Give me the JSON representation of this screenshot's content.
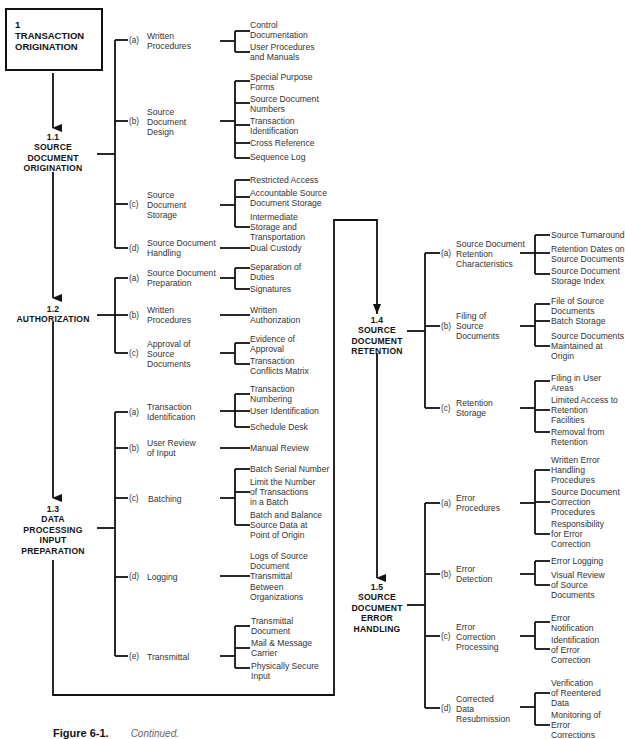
{
  "figure": {
    "label": "Figure 6-1.",
    "caption": "Continued."
  },
  "root": {
    "number": "1",
    "title_line1": "TRANSACTION",
    "title_line2": "ORIGINATION"
  },
  "sections": [
    {
      "id": "1.1",
      "title_lines": [
        "SOURCE",
        "DOCUMENT",
        "ORIGINATION"
      ],
      "items": [
        {
          "marker": "(a)",
          "label_lines": [
            "Written",
            "Procedures"
          ],
          "leaves": [
            [
              "Control",
              "Documentation"
            ],
            [
              "User Procedures",
              "and Manuals"
            ]
          ]
        },
        {
          "marker": "(b)",
          "label_lines": [
            "Source",
            "Document",
            "Design"
          ],
          "leaves": [
            [
              "Special Purpose",
              "Forms"
            ],
            [
              "Source Document",
              "Numbers"
            ],
            [
              "Transaction",
              "Identification"
            ],
            [
              "Cross Reference"
            ],
            [
              "Sequence Log"
            ]
          ]
        },
        {
          "marker": "(c)",
          "label_lines": [
            "Source",
            "Document",
            "Storage"
          ],
          "leaves": [
            [
              "Restricted Access"
            ],
            [
              "Accountable Source",
              "Document Storage"
            ],
            [
              "Intermediate",
              "Storage and",
              "Transportation"
            ]
          ]
        },
        {
          "marker": "(d)",
          "label_lines": [
            "Source Document",
            "Handling"
          ],
          "leaves": [
            [
              "Dual Custody"
            ]
          ]
        }
      ]
    },
    {
      "id": "1.2",
      "title_lines": [
        "AUTHORIZATION"
      ],
      "items": [
        {
          "marker": "(a)",
          "label_lines": [
            "Source Document",
            "Preparation"
          ],
          "leaves": [
            [
              "Separation of",
              "Duties"
            ],
            [
              "Signatures"
            ]
          ]
        },
        {
          "marker": "(b)",
          "label_lines": [
            "Written",
            "Procedures"
          ],
          "leaves": [
            [
              "Written",
              "Authorization"
            ]
          ]
        },
        {
          "marker": "(c)",
          "label_lines": [
            "Approval of",
            "Source",
            "Documents"
          ],
          "leaves": [
            [
              "Evidence of",
              "Approval"
            ],
            [
              "Transaction",
              "Conflicts Matrix"
            ]
          ]
        }
      ]
    },
    {
      "id": "1.3",
      "title_lines": [
        "DATA",
        "PROCESSING",
        "INPUT",
        "PREPARATION"
      ],
      "items": [
        {
          "marker": "(a)",
          "label_lines": [
            "Transaction",
            "Identification"
          ],
          "leaves": [
            [
              "Transaction",
              "Numbering"
            ],
            [
              "User Identification"
            ],
            [
              "Schedule Desk"
            ]
          ]
        },
        {
          "marker": "(b)",
          "label_lines": [
            "User Review",
            "of Input"
          ],
          "leaves": [
            [
              "Manual Review"
            ]
          ]
        },
        {
          "marker": "(c)",
          "label_lines": [
            "Batching"
          ],
          "leaves": [
            [
              "Batch Serial Number"
            ],
            [
              "Limit the Number",
              "of Transactions",
              "in a Batch"
            ],
            [
              "Batch and Balance",
              "Source Data at",
              "Point of Origin"
            ]
          ]
        },
        {
          "marker": "(d)",
          "label_lines": [
            "Logging"
          ],
          "leaves": [
            [
              "Logs of Source",
              "Document",
              "Transmittal",
              "Between",
              "Organizations"
            ]
          ]
        },
        {
          "marker": "(e)",
          "label_lines": [
            "Transmittal"
          ],
          "leaves": [
            [
              "Transmittal",
              "Document"
            ],
            [
              "Mail & Message",
              "Carrier"
            ],
            [
              "Physically Secure",
              "Input"
            ]
          ]
        }
      ]
    },
    {
      "id": "1.4",
      "title_lines": [
        "SOURCE",
        "DOCUMENT",
        "RETENTION"
      ],
      "items": [
        {
          "marker": "(a)",
          "label_lines": [
            "Source Document",
            "Retention",
            "Characteristics"
          ],
          "leaves": [
            [
              "Source Turnaround"
            ],
            [
              "Retention Dates on",
              "Source Documents"
            ],
            [
              "Source Document",
              "Storage Index"
            ]
          ]
        },
        {
          "marker": "(b)",
          "label_lines": [
            "Filing of",
            "Source",
            "Documents"
          ],
          "leaves": [
            [
              "File of Source",
              "Documents"
            ],
            [
              "Batch Storage"
            ],
            [
              "Source Documents",
              "Maintained at",
              "Origin"
            ]
          ]
        },
        {
          "marker": "(c)",
          "label_lines": [
            "Retention",
            "Storage"
          ],
          "leaves": [
            [
              "Filing in User",
              "Areas"
            ],
            [
              "Limited Access to",
              "Retention",
              "Facilities"
            ],
            [
              "Removal from",
              "Retention"
            ]
          ]
        }
      ]
    },
    {
      "id": "1.5",
      "title_lines": [
        "SOURCE",
        "DOCUMENT",
        "ERROR",
        "HANDLING"
      ],
      "items": [
        {
          "marker": "(a)",
          "label_lines": [
            "Error",
            "Procedures"
          ],
          "leaves": [
            [
              "Written Error",
              "Handling",
              "Procedures"
            ],
            [
              "Source Document",
              "Correction",
              "Procedures"
            ],
            [
              "Responsibility",
              "for Error",
              "Correction"
            ]
          ]
        },
        {
          "marker": "(b)",
          "label_lines": [
            "Error",
            "Detection"
          ],
          "leaves": [
            [
              "Error Logging"
            ],
            [
              "Visual Review",
              "of Source",
              "Documents"
            ]
          ]
        },
        {
          "marker": "(c)",
          "label_lines": [
            "Error",
            "Correction",
            "Processing"
          ],
          "leaves": [
            [
              "Error",
              "Notification"
            ],
            [
              "Identification",
              "of Error",
              "Correction"
            ]
          ]
        },
        {
          "marker": "(d)",
          "label_lines": [
            "Corrected",
            "Data",
            "Resubmission"
          ],
          "leaves": [
            [
              "Verification",
              "of Reentered",
              "Data"
            ],
            [
              "Monitoring of",
              "Error",
              "Corrections"
            ]
          ]
        }
      ]
    }
  ]
}
